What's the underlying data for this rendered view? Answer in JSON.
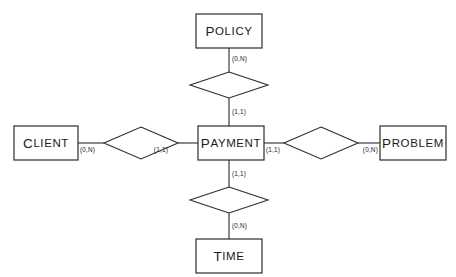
{
  "diagram": {
    "type": "entity-relationship-diagram",
    "notation": "min-max cardinality",
    "background_color": "#ffffff",
    "line_color": "#2b2b2b",
    "central_entity": "PAYMENT",
    "entities": [
      {
        "id": "policy",
        "label": "POLICY",
        "first_letter": "P",
        "rest": "OLICY",
        "position": "top",
        "box": {
          "x": 196,
          "y": 14,
          "w": 66,
          "h": 34
        }
      },
      {
        "id": "client",
        "label": "CLIENT",
        "first_letter": "C",
        "rest": "LIENT",
        "position": "left",
        "box": {
          "x": 14,
          "y": 126,
          "w": 64,
          "h": 34
        }
      },
      {
        "id": "payment",
        "label": "PAYMENT",
        "first_letter": "P",
        "rest": "AYMENT",
        "position": "center",
        "box": {
          "x": 198,
          "y": 126,
          "w": 66,
          "h": 34
        }
      },
      {
        "id": "problem",
        "label": "PROBLEM",
        "first_letter": "P",
        "rest": "ROBLEM",
        "position": "right",
        "box": {
          "x": 380,
          "y": 126,
          "w": 66,
          "h": 34
        }
      },
      {
        "id": "time",
        "label": "TIME",
        "first_letter": "T",
        "rest": "IME",
        "position": "bottom",
        "box": {
          "x": 196,
          "y": 239,
          "w": 66,
          "h": 34
        }
      }
    ],
    "relationships": [
      {
        "id": "rel-policy-payment",
        "label": "",
        "from": "policy",
        "to": "payment",
        "orientation": "vertical",
        "diamond": {
          "cx": 229,
          "cy": 85,
          "rx": 39,
          "ry": 13
        },
        "from_cardinality": "(0,N)",
        "to_cardinality": "(1,1)"
      },
      {
        "id": "rel-client-payment",
        "label": "",
        "from": "client",
        "to": "payment",
        "orientation": "horizontal",
        "diamond": {
          "cx": 141,
          "cy": 143,
          "rx": 37,
          "ry": 16
        },
        "from_cardinality": "(0,N)",
        "to_cardinality": "(1,1)"
      },
      {
        "id": "rel-payment-problem",
        "label": "",
        "from": "payment",
        "to": "problem",
        "orientation": "horizontal",
        "diamond": {
          "cx": 321,
          "cy": 143,
          "rx": 37,
          "ry": 16
        },
        "from_cardinality": "(1,1)",
        "to_cardinality": "(0,N)"
      },
      {
        "id": "rel-payment-time",
        "label": "",
        "from": "payment",
        "to": "time",
        "orientation": "vertical",
        "diamond": {
          "cx": 229,
          "cy": 200,
          "rx": 39,
          "ry": 13
        },
        "from_cardinality": "(1,1)",
        "to_cardinality": "(0,N)"
      }
    ],
    "cardinality_labels": [
      {
        "id": "card-policy",
        "text": "(0,N)",
        "x": 232,
        "y": 61
      },
      {
        "id": "card-payment-top",
        "text": "(1,1)",
        "x": 232,
        "y": 114
      },
      {
        "id": "card-client",
        "text": "(0,N)",
        "x": 80,
        "y": 152
      },
      {
        "id": "card-payment-left",
        "text": "(1,1)",
        "x": 168,
        "y": 152
      },
      {
        "id": "card-payment-right",
        "text": "(1,1)",
        "x": 266,
        "y": 152
      },
      {
        "id": "card-problem",
        "text": "(0,N)",
        "x": 357,
        "y": 152
      },
      {
        "id": "card-payment-bottom",
        "text": "(1,1)",
        "x": 232,
        "y": 176
      },
      {
        "id": "card-time",
        "text": "(0,N)",
        "x": 232,
        "y": 228
      }
    ]
  }
}
